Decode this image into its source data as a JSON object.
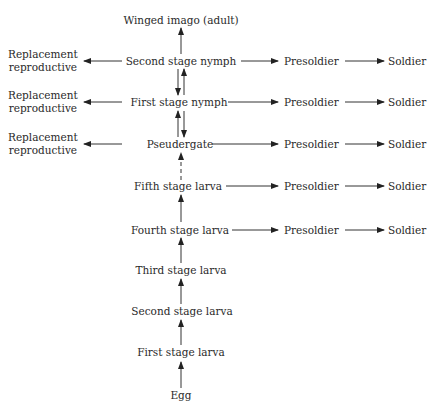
{
  "diagram": {
    "type": "flowchart",
    "main_stages": [
      {
        "id": "winged",
        "label": "Winged imago (adult)"
      },
      {
        "id": "nymph2",
        "label": "Second stage nymph"
      },
      {
        "id": "nymph1",
        "label": "First stage nymph"
      },
      {
        "id": "pseud",
        "label": "Pseudergate"
      },
      {
        "id": "larva5",
        "label": "Fifth stage larva"
      },
      {
        "id": "larva4",
        "label": "Fourth stage larva"
      },
      {
        "id": "larva3",
        "label": "Third stage larva"
      },
      {
        "id": "larva2",
        "label": "Second stage larva"
      },
      {
        "id": "larva1",
        "label": "First stage larva"
      },
      {
        "id": "egg",
        "label": "Egg"
      }
    ],
    "replacement_reproductive": {
      "line1": "Replacement",
      "line2": "reproductive"
    },
    "presoldier": "Presoldier",
    "soldier": "Soldier",
    "edges": [
      {
        "from": "egg",
        "to": "larva1"
      },
      {
        "from": "larva1",
        "to": "larva2"
      },
      {
        "from": "larva2",
        "to": "larva3"
      },
      {
        "from": "larva3",
        "to": "larva4"
      },
      {
        "from": "larva4",
        "to": "larva5"
      },
      {
        "from": "larva5",
        "to": "pseud",
        "style": "dashed"
      },
      {
        "from": "pseud",
        "to": "nymph1"
      },
      {
        "from": "nymph1",
        "to": "pseud"
      },
      {
        "from": "nymph1",
        "to": "nymph2"
      },
      {
        "from": "nymph2",
        "to": "nymph1"
      },
      {
        "from": "nymph2",
        "to": "winged"
      },
      {
        "from": "nymph2",
        "to": "replacement_reproductive"
      },
      {
        "from": "nymph1",
        "to": "replacement_reproductive"
      },
      {
        "from": "pseud",
        "to": "replacement_reproductive"
      },
      {
        "from": "nymph2",
        "to": "presoldier",
        "then": "soldier"
      },
      {
        "from": "nymph1",
        "to": "presoldier",
        "then": "soldier"
      },
      {
        "from": "pseud",
        "to": "presoldier",
        "then": "soldier"
      },
      {
        "from": "larva5",
        "to": "presoldier",
        "then": "soldier"
      },
      {
        "from": "larva4",
        "to": "presoldier",
        "then": "soldier"
      }
    ]
  }
}
